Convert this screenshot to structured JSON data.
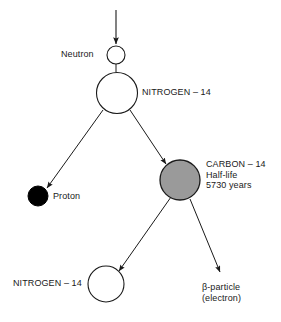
{
  "diagram": {
    "colors": {
      "stroke": "#1a1a1a",
      "background": "#ffffff",
      "fill_empty": "#ffffff",
      "fill_carbon": "#9a9a9a",
      "fill_proton": "#000000"
    },
    "nodes": [
      {
        "id": "neutron",
        "label": "Neutron",
        "shape": "circle-outline",
        "fill": "#ffffff",
        "cx": 116,
        "cy": 55,
        "r": 9,
        "label_side": "left"
      },
      {
        "id": "nitrogen-top",
        "label": "NITROGEN – 14",
        "shape": "circle-outline",
        "fill": "#ffffff",
        "cx": 117,
        "cy": 93,
        "r": 21,
        "label_side": "right"
      },
      {
        "id": "proton",
        "label": "Proton",
        "shape": "circle-filled",
        "fill": "#000000",
        "cx": 38,
        "cy": 196,
        "r": 10,
        "label_side": "right"
      },
      {
        "id": "carbon",
        "label": "CARBON – 14\nHalf-life\n5730 years",
        "label_lines": [
          "CARBON – 14",
          "Half-life",
          "5730 years"
        ],
        "shape": "circle-filled-gray",
        "fill": "#9a9a9a",
        "cx": 180,
        "cy": 180,
        "r": 20,
        "label_side": "right"
      },
      {
        "id": "nitrogen-bottom",
        "label": "NITROGEN – 14",
        "shape": "circle-outline",
        "fill": "#ffffff",
        "cx": 106,
        "cy": 284,
        "r": 18,
        "label_side": "left"
      },
      {
        "id": "beta-particle",
        "label": "β-particle\n(electron)",
        "label_lines": [
          "β-particle",
          "(electron)"
        ],
        "shape": "none",
        "cx": 222,
        "cy": 274,
        "r": 0,
        "label_side": "below"
      }
    ],
    "arrows": [
      {
        "id": "arrow-incoming-neutron",
        "from": "external-top",
        "to": "neutron",
        "x1": 116,
        "y1": 10,
        "x2": 116,
        "y2": 44
      },
      {
        "id": "arrow-neutron-nitrogen",
        "from": "neutron",
        "to": "nitrogen-top",
        "x1": 116,
        "y1": 64,
        "x2": 116,
        "y2": 71,
        "headless": true
      },
      {
        "id": "arrow-nitrogen-proton",
        "from": "nitrogen-top",
        "to": "proton",
        "x1": 102,
        "y1": 110,
        "x2": 46,
        "y2": 188
      },
      {
        "id": "arrow-nitrogen-carbon",
        "from": "nitrogen-top",
        "to": "carbon",
        "x1": 129,
        "y1": 111,
        "x2": 166,
        "y2": 165
      },
      {
        "id": "arrow-carbon-nitrogen",
        "from": "carbon",
        "to": "nitrogen-bottom",
        "x1": 170,
        "y1": 198,
        "x2": 118,
        "y2": 271
      },
      {
        "id": "arrow-carbon-beta",
        "from": "carbon",
        "to": "beta-particle",
        "x1": 190,
        "y1": 199,
        "x2": 220,
        "y2": 273
      }
    ]
  }
}
